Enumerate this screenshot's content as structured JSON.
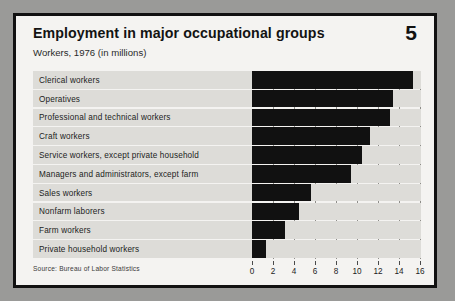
{
  "document": {
    "title": "Employment in major occupational groups",
    "subtitle": "Workers, 1976 (in millions)",
    "page_number": "5",
    "source": "Source: Bureau of Labor Statistics"
  },
  "colors": {
    "page_background": "#f4f3f1",
    "outer_background": "#9a9a98",
    "border": "#111111",
    "bar": "#111111",
    "row_band": "#dddcd8",
    "gridline": "#8e8d89"
  },
  "chart_data": {
    "type": "bar",
    "orientation": "horizontal",
    "title": "Employment in major occupational groups",
    "subtitle": "Workers, 1976 (in millions)",
    "xlabel": "",
    "ylabel": "",
    "xlim": [
      0,
      16
    ],
    "xticks": [
      0,
      2,
      4,
      6,
      8,
      10,
      12,
      14,
      16
    ],
    "xtick_labels": [
      "0",
      "2",
      "4",
      "6",
      "8",
      "10",
      "12",
      "14",
      "16"
    ],
    "grid": true,
    "legend": false,
    "units": "millions of workers",
    "categories": [
      "Clerical workers",
      "Operatives",
      "Professional and technical workers",
      "Craft workers",
      "Service workers, except private household",
      "Managers and administrators, except  farm",
      "Sales workers",
      "Nonfarm laborers",
      "Farm workers",
      "Private household workers"
    ],
    "values": [
      15.3,
      13.4,
      13.1,
      11.2,
      10.5,
      9.4,
      5.6,
      4.5,
      3.1,
      1.3
    ]
  }
}
